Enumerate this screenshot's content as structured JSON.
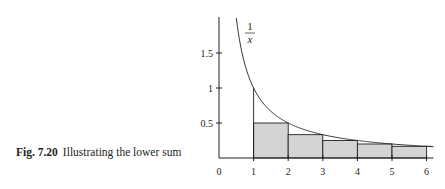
{
  "caption": {
    "number": "Fig. 7.20",
    "text": "Illustrating the lower sum"
  },
  "chart_data": {
    "type": "area",
    "title": "Illustrating the lower sum",
    "function_label": "1/x",
    "function_label_num": "1",
    "function_label_den": "x",
    "xlabel": "",
    "ylabel": "",
    "xlim": [
      0,
      6.2
    ],
    "ylim": [
      0,
      1.95
    ],
    "x_ticks": [
      "0",
      "1",
      "2",
      "3",
      "4",
      "5",
      "6"
    ],
    "y_ticks": [
      "0.5",
      "1",
      "1.5"
    ],
    "curve": {
      "f": "1/x",
      "x_start": 0.5,
      "x_end": 6.2
    },
    "rectangles": [
      {
        "x0": 1,
        "x1": 2,
        "height": 0.5
      },
      {
        "x0": 2,
        "x1": 3,
        "height": 0.3333
      },
      {
        "x0": 3,
        "x1": 4,
        "height": 0.25
      },
      {
        "x0": 4,
        "x1": 5,
        "height": 0.2
      },
      {
        "x0": 5,
        "x1": 6,
        "height": 0.1667
      }
    ],
    "vertical_line_at_x1_height": 1.0,
    "fill_color": "#d4d4d4",
    "line_color": "#231f20",
    "grid": false,
    "legend": "none"
  }
}
